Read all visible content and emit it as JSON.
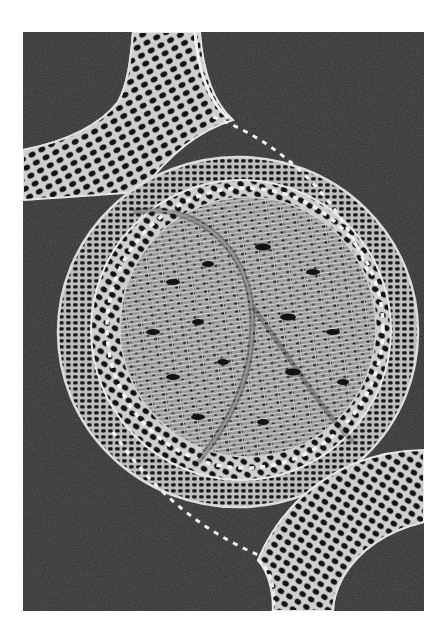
{
  "image": {
    "alt": "Black and white photograph of knitted lace: a large circular lace medallion with concentric rings, joined by two curved lace bands at upper-left and lower-right, on a dark grey background",
    "colors": {
      "page_background": "#ffffff",
      "photo_background": "#2d2d2d",
      "lace_thread": "#e6e6e6",
      "lace_dim": "#b4b4b4",
      "hole_dark": "#111111",
      "bead_highlight": "#f4f4f4"
    }
  }
}
